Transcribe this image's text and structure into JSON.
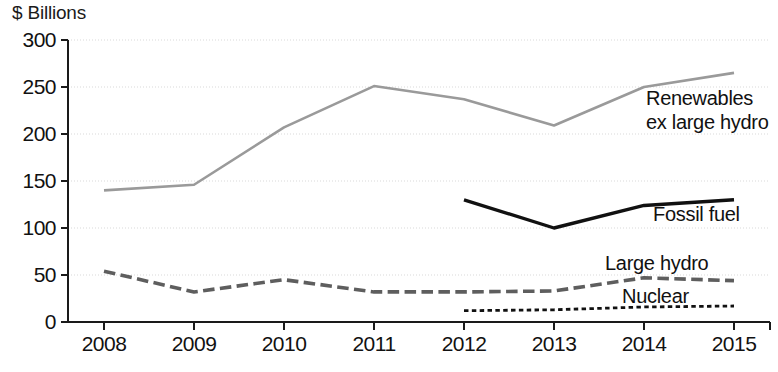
{
  "chart_data": {
    "type": "line",
    "title": "",
    "subtitle": "",
    "xlabel": "",
    "ylabel": "$ Billions",
    "unit_label": "$ Billions",
    "categories": [
      "2008",
      "2009",
      "2010",
      "2011",
      "2012",
      "2013",
      "2014",
      "2015"
    ],
    "x": [
      2008,
      2009,
      2010,
      2011,
      2012,
      2013,
      2014,
      2015
    ],
    "xlim": [
      2007.6,
      2015.4
    ],
    "ylim": [
      0,
      300
    ],
    "yticks": [
      0,
      50,
      100,
      150,
      200,
      250,
      300
    ],
    "ytick_labels": [
      "0",
      "50",
      "100",
      "150",
      "200",
      "250",
      "300"
    ],
    "grid": true,
    "grid_axis": "y",
    "legend": "none",
    "legend_position": "inline-annotations",
    "series": [
      {
        "name": "Renewables ex large hydro",
        "label_line1": "Renewables",
        "label_line2": "ex large hydro",
        "color": "#9a9a9a",
        "style": "solid",
        "width": 2.6,
        "x": [
          2008,
          2009,
          2010,
          2011,
          2012,
          2013,
          2014,
          2015
        ],
        "values": [
          140,
          146,
          207,
          251,
          237,
          209,
          250,
          265
        ]
      },
      {
        "name": "Fossil fuel",
        "label_line1": "Fossil fuel",
        "color": "#111111",
        "style": "solid",
        "width": 3.4,
        "x": [
          2012,
          2013,
          2014,
          2015
        ],
        "values": [
          130,
          100,
          124,
          130
        ]
      },
      {
        "name": "Large hydro",
        "label_line1": "Large hydro",
        "color": "#5e5e5e",
        "style": "dashed",
        "width": 3.6,
        "x": [
          2008,
          2009,
          2010,
          2011,
          2012,
          2013,
          2014,
          2015
        ],
        "values": [
          54,
          32,
          45,
          32,
          32,
          33,
          47,
          44
        ]
      },
      {
        "name": "Nuclear",
        "label_line1": "Nuclear",
        "color": "#111111",
        "style": "dotted",
        "width": 2.8,
        "x": [
          2012,
          2013,
          2014,
          2015
        ],
        "values": [
          12,
          13,
          16,
          17
        ]
      }
    ],
    "annotations": [
      {
        "text": "Renewables",
        "series": "Renewables ex large hydro"
      },
      {
        "text": "ex large hydro",
        "series": "Renewables ex large hydro"
      },
      {
        "text": "Fossil fuel",
        "series": "Fossil fuel"
      },
      {
        "text": "Large hydro",
        "series": "Large hydro"
      },
      {
        "text": "Nuclear",
        "series": "Nuclear"
      }
    ]
  },
  "annotation_text": {
    "renewables_line1": "Renewables",
    "renewables_line2": "ex large hydro",
    "fossil_fuel": "Fossil fuel",
    "large_hydro": "Large hydro",
    "nuclear": "Nuclear"
  },
  "footer_artifact": ""
}
